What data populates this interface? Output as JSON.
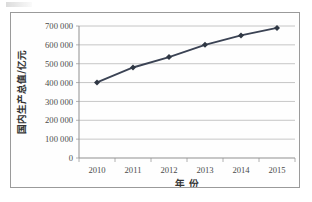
{
  "chart_data": {
    "type": "line",
    "title": "",
    "xlabel": "年 份",
    "ylabel": "国内生产总值/亿元",
    "categories": [
      "2010",
      "2011",
      "2012",
      "2013",
      "2014",
      "2015"
    ],
    "values": [
      401000,
      480000,
      535000,
      600000,
      650000,
      690000
    ],
    "series": [
      {
        "name": "国内生产总值",
        "values": [
          401000,
          480000,
          535000,
          600000,
          650000,
          690000
        ]
      }
    ],
    "ylim": [
      0,
      700000
    ],
    "ytick_values": [
      0,
      100000,
      200000,
      300000,
      400000,
      500000,
      600000,
      700000
    ],
    "ytick_labels": [
      "0",
      "100 000",
      "200 000",
      "300 000",
      "400 000",
      "500 000",
      "600 000",
      "700 000"
    ],
    "xtick_labels": [
      "2010",
      "2011",
      "2012",
      "2013",
      "2014",
      "2015"
    ],
    "grid": true,
    "grid_axis": "y",
    "legend": false,
    "legend_position": "none",
    "marker": "diamond",
    "colors": {
      "series_line": "#3b4354",
      "marker": "#2f3744",
      "gridline": "#b8b8b8",
      "axis": "#909090",
      "frame_border": "#9a9a9a",
      "background": "#fefefe",
      "tick_label": "#4a4a4a",
      "axis_title": "#333333"
    }
  }
}
